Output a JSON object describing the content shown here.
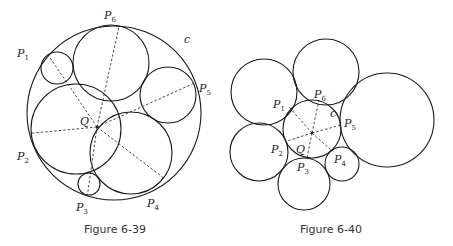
{
  "figures": [
    {
      "id": "fig-6-39",
      "caption": "Figure 6-39",
      "caption_pos": [
        115,
        233
      ],
      "outer_circle": {
        "label": "c",
        "cx": 114,
        "cy": 113,
        "r": 87,
        "label_pos": [
          184,
          43
        ]
      },
      "center": {
        "label": "Q",
        "x": 97,
        "y": 127,
        "label_pos": [
          80,
          125
        ]
      },
      "circles": [
        {
          "name": "P1",
          "cx": 57,
          "cy": 68,
          "r": 16,
          "tangent": [
            36,
            57
          ],
          "label_pos": [
            17,
            57
          ]
        },
        {
          "name": "P2",
          "cx": 76,
          "cy": 129,
          "r": 45,
          "tangent": [
            32,
            149
          ],
          "label_pos": [
            17,
            160
          ]
        },
        {
          "name": "P3",
          "cx": 89,
          "cy": 184,
          "r": 11,
          "tangent": [
            85,
            198
          ],
          "label_pos": [
            76,
            211
          ]
        },
        {
          "name": "P4",
          "cx": 131,
          "cy": 153,
          "r": 41,
          "tangent": [
            165,
            195
          ],
          "label_pos": [
            147,
            207
          ]
        },
        {
          "name": "P5",
          "cx": 168,
          "cy": 95,
          "r": 28,
          "tangent": [
            196,
            89
          ],
          "label_pos": [
            199,
            92
          ]
        },
        {
          "name": "P6",
          "cx": 111,
          "cy": 63,
          "r": 38,
          "tangent": [
            112,
            25
          ],
          "label_pos": [
            104,
            19
          ]
        }
      ]
    },
    {
      "id": "fig-6-40",
      "caption": "Figure 6-40",
      "caption_pos": [
        331,
        233
      ],
      "outer_circle": {
        "label": "c",
        "cx": 312,
        "cy": 129,
        "r": 29,
        "label_pos": [
          330,
          117
        ]
      },
      "center": {
        "label": "Q",
        "x": 312,
        "y": 133,
        "label_pos": [
          296,
          153
        ]
      },
      "circles": [
        {
          "name": "P1",
          "cx": 264,
          "cy": 92,
          "r": 33,
          "tangent": [
            289,
            107
          ],
          "label_pos": [
            273,
            108
          ]
        },
        {
          "name": "P2",
          "cx": 259,
          "cy": 152,
          "r": 29,
          "tangent": [
            287,
            141
          ],
          "label_pos": [
            271,
            153
          ]
        },
        {
          "name": "P3",
          "cx": 304,
          "cy": 184,
          "r": 26,
          "tangent": [
            307,
            158
          ],
          "label_pos": [
            297,
            171
          ]
        },
        {
          "name": "P4",
          "cx": 342,
          "cy": 164,
          "r": 17,
          "tangent": [
            331,
            150
          ],
          "label_pos": [
            334,
            163
          ]
        },
        {
          "name": "P5",
          "cx": 387,
          "cy": 120,
          "r": 47,
          "tangent": [
            341,
            125
          ],
          "label_pos": [
            344,
            127
          ]
        },
        {
          "name": "P6",
          "cx": 326,
          "cy": 72,
          "r": 33,
          "tangent": [
            319,
            100
          ],
          "label_pos": [
            314,
            98
          ]
        }
      ]
    }
  ]
}
